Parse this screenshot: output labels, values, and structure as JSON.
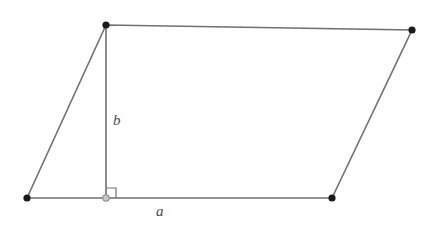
{
  "figure": {
    "kind": "parallelogram-with-altitude",
    "background_color": "#ffffff",
    "stroke_color": "#707070",
    "vertex_color": "#1a1a1a",
    "foot_marker_color": "#c8c8c8",
    "label_color": "#4a4a4a",
    "width": 437,
    "height": 231
  },
  "labels": {
    "base": "a",
    "height": "b"
  },
  "vertices": {
    "bottom_left": {
      "name": "bottom-left-vertex",
      "x": 27,
      "y": 198
    },
    "top_left": {
      "name": "top-left-vertex",
      "x": 106,
      "y": 25
    },
    "top_right": {
      "name": "top-right-vertex",
      "x": 412,
      "y": 30
    },
    "bottom_right": {
      "name": "bottom-right-vertex",
      "x": 332,
      "y": 198
    },
    "altitude_foot": {
      "name": "altitude-foot-point",
      "x": 106,
      "y": 198
    }
  },
  "edges": {
    "top": {
      "name": "top-edge",
      "from": "top_left",
      "to": "top_right"
    },
    "right": {
      "name": "right-edge",
      "from": "top_right",
      "to": "bottom_right"
    },
    "bottom": {
      "name": "bottom-edge",
      "from": "bottom_right",
      "to": "bottom_left"
    },
    "left": {
      "name": "left-edge",
      "from": "bottom_left",
      "to": "top_left"
    },
    "altitude": {
      "name": "altitude-segment",
      "from": "top_left",
      "to": "altitude_foot"
    }
  },
  "geometry": {
    "paths": {
      "outline": "M 27 198 L 106 25 L 412 30 L 332 198 Z",
      "altitude": "M 106 25 L 106 198",
      "right_angle": "M 106 188 L 116 188 L 116 198"
    }
  },
  "annotations": {
    "right_angle_marker": {
      "name": "right-angle-marker",
      "size": 10
    }
  }
}
